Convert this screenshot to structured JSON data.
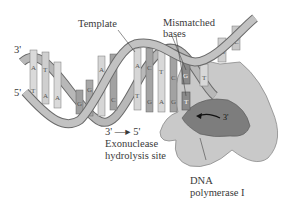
{
  "diagram": {
    "labels": {
      "template": "Template",
      "mismatched": "Mismatched\nbases",
      "mismatched_line1": "Mismatched",
      "mismatched_line2": "bases",
      "three_prime_top": "3'",
      "five_prime_left": "5'",
      "three_prime_enzyme": "3'",
      "direction_from": "3'",
      "direction_arrow": "—▸",
      "direction_to": "5'",
      "exo_line1": "Exonuclease",
      "exo_line2": "hydrolysis site",
      "enzyme_line1": "DNA",
      "enzyme_line2": "polymerase I"
    },
    "bases": [
      "A",
      "T",
      "T",
      "A",
      "A",
      "G",
      "G",
      "C",
      "A",
      "G",
      "T",
      "G",
      "C",
      "G",
      "A",
      "G",
      "C",
      "T",
      "G",
      "C",
      "G",
      "T",
      "T",
      "G",
      "C"
    ],
    "colors": {
      "backbone": "#b5b5b5",
      "backbone_edge": "#6a6a6a",
      "base_light": "#d9d9d9",
      "base_dark": "#9a9a9a",
      "enzyme_light": "#c8c8c8",
      "enzyme_dark": "#7a7a7a",
      "mismatch": "#8c8c8c"
    }
  }
}
